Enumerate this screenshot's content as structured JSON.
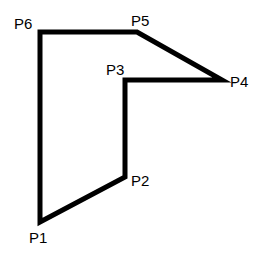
{
  "diagram": {
    "type": "polygon",
    "stroke_color": "#000000",
    "stroke_width": 5,
    "points": [
      {
        "id": "P1",
        "label": "P1",
        "x": 40,
        "y": 222,
        "label_x": 29,
        "label_y": 243
      },
      {
        "id": "P2",
        "label": "P2",
        "x": 125,
        "y": 177,
        "label_x": 131,
        "label_y": 186
      },
      {
        "id": "P3",
        "label": "P3",
        "x": 125,
        "y": 80,
        "label_x": 106,
        "label_y": 75
      },
      {
        "id": "P4",
        "label": "P4",
        "x": 222,
        "y": 80,
        "label_x": 230,
        "label_y": 87
      },
      {
        "id": "P5",
        "label": "P5",
        "x": 137,
        "y": 32,
        "label_x": 131,
        "label_y": 26
      },
      {
        "id": "P6",
        "label": "P6",
        "x": 40,
        "y": 32,
        "label_x": 14,
        "label_y": 29
      }
    ]
  }
}
